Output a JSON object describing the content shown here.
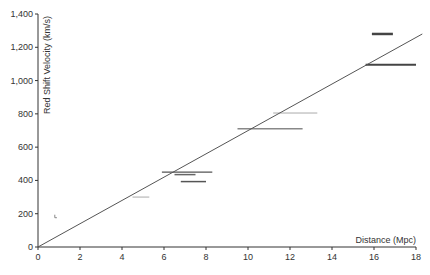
{
  "chart_data": {
    "type": "scatter",
    "title": "",
    "xlabel": "Distance (Mpc)",
    "ylabel": "Red Shift Velocity (km/s)",
    "xlim": [
      0,
      18
    ],
    "ylim": [
      0,
      1400
    ],
    "xticks": [
      0,
      2,
      4,
      6,
      8,
      10,
      12,
      14,
      16,
      18
    ],
    "yticks": [
      0,
      200,
      400,
      600,
      800,
      1000,
      1200,
      1400
    ],
    "ytick_labels": [
      "0",
      "200",
      "400",
      "600",
      "800",
      "1,000",
      "1,200",
      "1,400"
    ],
    "grid": false,
    "legend": null,
    "series": [
      {
        "name": "Galaxy distance ranges (horizontal error bars)",
        "points": [
          {
            "x_min": 0.8,
            "x_max": 0.9,
            "y": 176,
            "color": "#888888",
            "weight": 1
          },
          {
            "x_min": 4.5,
            "x_max": 5.3,
            "y": 300,
            "color": "#aaaaaa",
            "weight": 1
          },
          {
            "x_min": 5.9,
            "x_max": 8.3,
            "y": 450,
            "color": "#555555",
            "weight": 1.2
          },
          {
            "x_min": 6.5,
            "x_max": 7.5,
            "y": 435,
            "color": "#666666",
            "weight": 1.5
          },
          {
            "x_min": 6.8,
            "x_max": 8.0,
            "y": 393,
            "color": "#555555",
            "weight": 1.5
          },
          {
            "x_min": 9.5,
            "x_max": 12.6,
            "y": 710,
            "color": "#888888",
            "weight": 1.5
          },
          {
            "x_min": 11.2,
            "x_max": 13.3,
            "y": 805,
            "color": "#aaaaaa",
            "weight": 1
          },
          {
            "x_min": 15.6,
            "x_max": 18.0,
            "y": 1095,
            "color": "#444444",
            "weight": 2
          },
          {
            "x_min": 15.9,
            "x_max": 16.9,
            "y": 1280,
            "color": "#444444",
            "weight": 2.5
          }
        ]
      },
      {
        "name": "Hubble fit line",
        "type": "line",
        "x": [
          0,
          18.3
        ],
        "y": [
          0,
          1280
        ],
        "color": "#555555"
      }
    ]
  }
}
